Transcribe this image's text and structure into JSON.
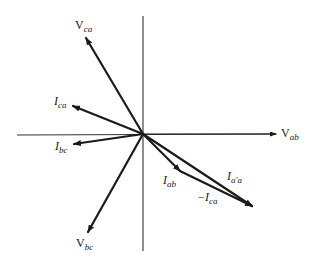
{
  "diagram": {
    "colors": {
      "ink": "#1a1a1a",
      "axis": "#333333",
      "background": "#ffffff"
    },
    "origin": {
      "x": 143,
      "y": 134
    },
    "axes": {
      "horizontal": {
        "x1": 17,
        "y1": 135,
        "x2": 276,
        "y2": 134,
        "arrow": true
      },
      "vertical": {
        "x1": 143,
        "y1": 16,
        "x2": 143,
        "y2": 251,
        "arrow": false
      }
    },
    "phasors": [
      {
        "id": "V_ab",
        "from": [
          143,
          134
        ],
        "to": [
          276,
          134
        ],
        "weight": 1.2
      },
      {
        "id": "V_ca",
        "from": [
          143,
          134
        ],
        "to": [
          86,
          38
        ],
        "weight": 2.2
      },
      {
        "id": "I_ca",
        "from": [
          143,
          134
        ],
        "to": [
          73,
          106
        ],
        "weight": 2.2
      },
      {
        "id": "I_bc",
        "from": [
          143,
          134
        ],
        "to": [
          74,
          144
        ],
        "weight": 2.2
      },
      {
        "id": "V_bc",
        "from": [
          143,
          134
        ],
        "to": [
          88,
          232
        ],
        "weight": 2.2
      },
      {
        "id": "I_ab",
        "from": [
          143,
          134
        ],
        "to": [
          180,
          171
        ],
        "weight": 2.2
      },
      {
        "id": "I_a'a",
        "from": [
          143,
          134
        ],
        "to": [
          252,
          206
        ],
        "weight": 2.2
      },
      {
        "id": "-I_ca",
        "from": [
          180,
          171
        ],
        "to": [
          252,
          206
        ],
        "weight": 2.2
      }
    ],
    "labels": {
      "v_ab": {
        "main": "V",
        "sub": "ab",
        "x": 281,
        "y": 127
      },
      "v_ca": {
        "main": "V",
        "sub": "ca",
        "x": 75,
        "y": 19
      },
      "i_ca": {
        "main": "I",
        "sub": "ca",
        "x": 54,
        "y": 95
      },
      "i_bc": {
        "main": "I",
        "sub": "bc",
        "x": 55,
        "y": 140
      },
      "v_bc": {
        "main": "V",
        "sub": "bc",
        "x": 76,
        "y": 237
      },
      "i_ab": {
        "main": "I",
        "sub": "ab",
        "x": 163,
        "y": 174
      },
      "i_aa": {
        "main": "I",
        "sub": "a'a",
        "x": 227,
        "y": 170
      },
      "neg_i_ca": {
        "main": "−I",
        "sub": "ca",
        "x": 197,
        "y": 191
      }
    }
  }
}
